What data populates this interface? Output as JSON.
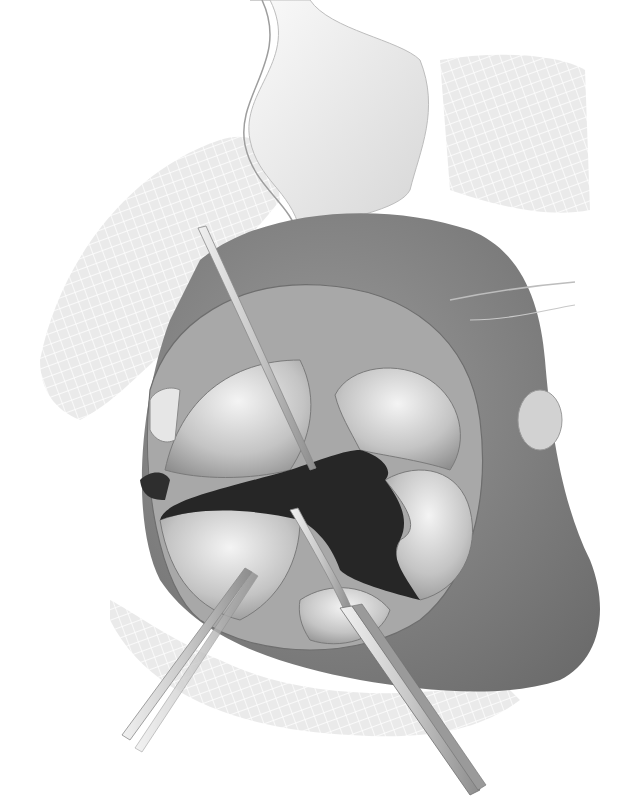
{
  "image": {
    "kind": "grayscale surgical illustration",
    "width": 628,
    "height": 812,
    "background": "#ffffff"
  },
  "colors": {
    "drape_mesh": "#e6e6e6",
    "drape_mesh_line": "#ffffff",
    "retractor_blade": "#ececec",
    "tissue_dark": "#7a7a7a",
    "tissue_mid": "#9c9c9c",
    "leaflet_light": "#c9c9c9",
    "leaflet_highlight": "#f2f2f2",
    "orifice": "#2a2a2a",
    "instrument": "#d8d8d8",
    "instrument_edge": "#8a8a8a"
  },
  "elements": {
    "drapes": [
      "upper-left gauze drape",
      "upper-right gauze drape",
      "lower gauze drape"
    ],
    "retractor": "curved retractor blade at top",
    "structure": "opened valve with leaflets and central dark orifice",
    "instruments": [
      "probe from upper-left",
      "forceps from lower-left",
      "forceps from lower-right"
    ]
  }
}
